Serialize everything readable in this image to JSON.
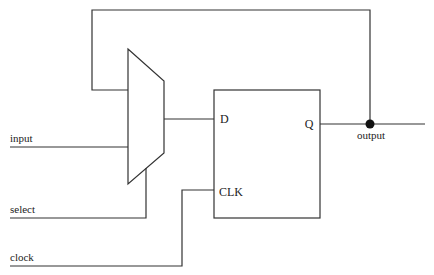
{
  "diagram": {
    "type": "sequential-circuit",
    "components": {
      "mux": {
        "name": "2-to-1 multiplexer"
      },
      "flipflop": {
        "name": "D flip-flop",
        "pin_d": "D",
        "pin_clk": "CLK",
        "pin_q": "Q"
      },
      "junction": {
        "name": "output node"
      }
    },
    "signals": {
      "input": "input",
      "select": "select",
      "clock": "clock",
      "output": "output"
    },
    "connections": [
      {
        "from": "input",
        "to": "mux"
      },
      {
        "from": "select",
        "to": "mux.select"
      },
      {
        "from": "mux",
        "to": "flipflop.D"
      },
      {
        "from": "clock",
        "to": "flipflop.CLK"
      },
      {
        "from": "flipflop.Q",
        "to": "output"
      },
      {
        "from": "output",
        "to": "mux",
        "label": "feedback"
      }
    ]
  }
}
